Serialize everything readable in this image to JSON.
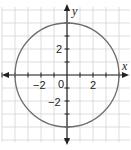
{
  "chart_data": {
    "type": "line",
    "title": "",
    "xlabel": "x",
    "ylabel": "y",
    "xlim": [
      -5,
      5
    ],
    "ylim": [
      -5,
      5
    ],
    "grid": true,
    "grid_step": 1,
    "x_tick_labels": [
      {
        "value": -2,
        "label": "−2"
      },
      {
        "value": 0,
        "label": "0"
      },
      {
        "value": 2,
        "label": "2"
      }
    ],
    "y_tick_labels": [
      {
        "value": 2,
        "label": "2"
      },
      {
        "value": -2,
        "label": "−2"
      }
    ],
    "series": [
      {
        "name": "circle",
        "shape": "circle",
        "center": [
          0,
          0
        ],
        "radius": 4,
        "equation": "x^2 + y^2 = 16",
        "intercepts": [
          [
            4,
            0
          ],
          [
            -4,
            0
          ],
          [
            0,
            4
          ],
          [
            0,
            -4
          ]
        ]
      }
    ],
    "colors": {
      "curve": "#6e6e6e",
      "axis": "#222222",
      "grid": "#d4d4d4"
    }
  },
  "labels": {
    "x_axis": "x",
    "y_axis": "y",
    "origin": "0",
    "x_neg2": "−2",
    "x_pos2": "2",
    "y_pos2": "2",
    "y_neg2": "−2"
  }
}
